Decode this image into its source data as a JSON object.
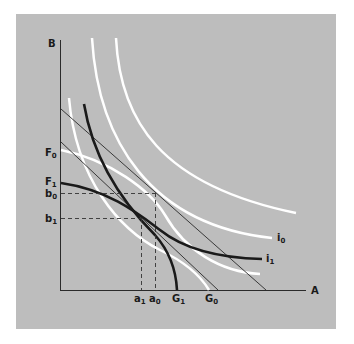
{
  "diagram": {
    "type": "economics indifference/transformation curve diagram",
    "background_color": "#bdbdbd",
    "axes": {
      "x_label": "A",
      "y_label": "B"
    },
    "y_axis_labels": [
      {
        "id": "F0",
        "base": "F",
        "sub": "0"
      },
      {
        "id": "F1",
        "base": "F",
        "sub": "1"
      },
      {
        "id": "b0",
        "base": "b",
        "sub": "0"
      },
      {
        "id": "b1",
        "base": "b",
        "sub": "1"
      }
    ],
    "x_axis_labels": [
      {
        "id": "a1",
        "base": "a",
        "sub": "1"
      },
      {
        "id": "a0",
        "base": "a",
        "sub": "0"
      },
      {
        "id": "G1",
        "base": "G",
        "sub": "1"
      },
      {
        "id": "G0",
        "base": "G",
        "sub": "0"
      }
    ],
    "curve_labels": [
      {
        "id": "i0",
        "base": "i",
        "sub": "0"
      },
      {
        "id": "i1",
        "base": "i",
        "sub": "1"
      }
    ],
    "colors": {
      "white_curves": "#ffffff",
      "black_curves": "#1a1a1a",
      "thin_lines": "#2a2a2a"
    }
  }
}
